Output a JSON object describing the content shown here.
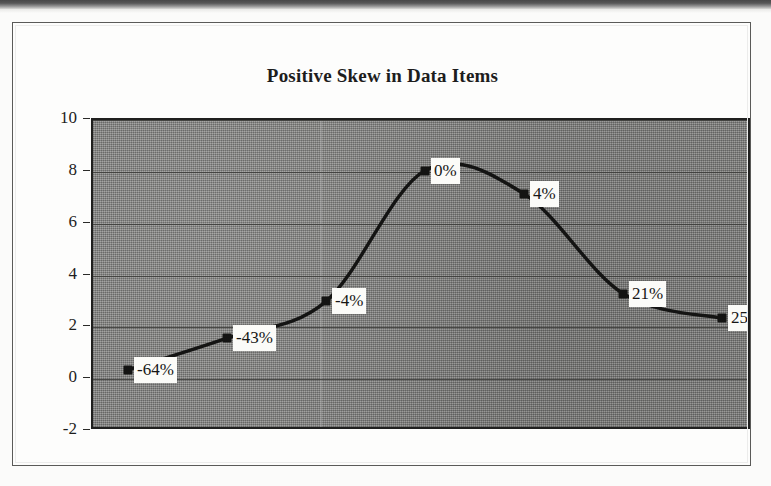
{
  "figure": {
    "title": "Positive Skew in Data Items",
    "frame_color": "#5a5a58",
    "plot_background_color": "#8b8b89",
    "series_color": "#141413",
    "label_background_color": "#fbfbf8"
  },
  "chart_data": {
    "type": "line",
    "title": "Positive Skew in Data Items",
    "xlabel": "",
    "ylabel": "",
    "ylim": [
      -2,
      10
    ],
    "ytick_labels": [
      "10",
      "8",
      "6",
      "4",
      "2",
      "0",
      "-2"
    ],
    "yticks": [
      10,
      8,
      6,
      4,
      2,
      0,
      -2
    ],
    "grid": true,
    "grid_axis": "y",
    "legend": false,
    "smoothed_line": true,
    "marker": "square",
    "x": [
      1,
      2,
      3,
      4,
      5,
      6,
      7
    ],
    "categories": [
      "-64%",
      "-43%",
      "-4%",
      "0%",
      "4%",
      "21%",
      "25%"
    ],
    "values": [
      0.36,
      1.58,
      3.0,
      8.05,
      7.15,
      3.3,
      2.35
    ],
    "point_labels": [
      "-64%",
      "-43%",
      "-4%",
      "0%",
      "4%",
      "21%",
      "25%"
    ],
    "series": [
      {
        "name": "Data Items",
        "values": [
          0.36,
          1.58,
          3.0,
          8.05,
          7.15,
          3.3,
          2.35
        ]
      }
    ]
  },
  "axis": {
    "y_labels": [
      {
        "text": "10",
        "value": 10
      },
      {
        "text": "8",
        "value": 8
      },
      {
        "text": "6",
        "value": 6
      },
      {
        "text": "4",
        "value": 4
      },
      {
        "text": "2",
        "value": 2
      },
      {
        "text": "0",
        "value": 0
      },
      {
        "text": "-2",
        "value": -2
      }
    ]
  },
  "points": [
    {
      "label": "-64%",
      "value": 0.36,
      "x": 1
    },
    {
      "label": "-43%",
      "value": 1.58,
      "x": 2
    },
    {
      "label": "-4%",
      "value": 3.0,
      "x": 3
    },
    {
      "label": "0%",
      "value": 8.05,
      "x": 4
    },
    {
      "label": "4%",
      "value": 7.15,
      "x": 5
    },
    {
      "label": "21%",
      "value": 3.3,
      "x": 6
    },
    {
      "label": "25%",
      "value": 2.35,
      "x": 7
    }
  ]
}
